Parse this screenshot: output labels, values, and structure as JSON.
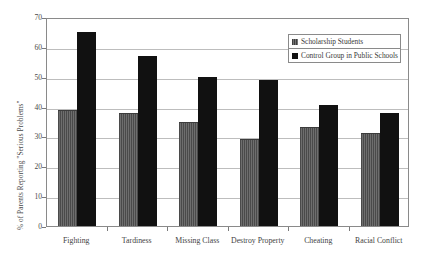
{
  "chart_data": {
    "type": "bar",
    "title": "",
    "xlabel": "",
    "ylabel": "% of Parents Reporting \"Serious Problems\"",
    "ylim": [
      0,
      70
    ],
    "yticks": [
      0,
      10,
      20,
      30,
      40,
      50,
      60,
      70
    ],
    "ytick_labels": [
      "0",
      "10",
      "20",
      "30",
      "40",
      "50",
      "60",
      "70"
    ],
    "grid": true,
    "legend_position": "top-right",
    "categories": [
      "Fighting",
      "Tardiness",
      "Missing Class",
      "Destroy Property",
      "Cheating",
      "Racial Conflict"
    ],
    "series": [
      {
        "name": "Scholarship Students",
        "color": "#5a5a5a",
        "values": [
          39,
          38,
          35,
          29,
          33,
          31
        ]
      },
      {
        "name": "Control Group in Public Schools",
        "color": "#111111",
        "values": [
          65,
          57,
          50,
          49,
          40.5,
          38
        ]
      }
    ]
  }
}
